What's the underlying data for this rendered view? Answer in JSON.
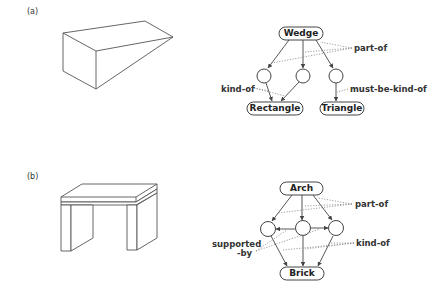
{
  "panels": [
    {
      "label": "(a)",
      "object": "wedge-drawing",
      "graph": {
        "root": "Wedge",
        "leaves": [
          "Rectangle",
          "Triangle"
        ],
        "relations": {
          "part_of": "part-of",
          "kind_of": "kind-of",
          "must_be_kind_of": "must-be-kind-of"
        }
      }
    },
    {
      "label": "(b)",
      "object": "arch-drawing",
      "graph": {
        "root": "Arch",
        "leaves": [
          "Brick"
        ],
        "relations": {
          "part_of": "part-of",
          "supported_by_line1": "supported",
          "supported_by_line2": "-by",
          "kind_of": "kind-of"
        }
      }
    }
  ],
  "colors": {
    "line": "#444444",
    "dotted": "#888888",
    "background": "#ffffff"
  }
}
